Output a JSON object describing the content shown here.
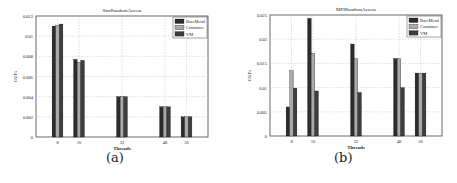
{
  "chart_data": [
    {
      "type": "bar",
      "title": "StarRandomAccess",
      "xlabel": "Threads",
      "ylabel": "GUPs",
      "categories": [
        "8",
        "16",
        "32",
        "48",
        "56"
      ],
      "x_positions": [
        8,
        16,
        32,
        48,
        56
      ],
      "ylim": [
        0,
        0.012
      ],
      "yticks": [
        0,
        0.002,
        0.004,
        0.006,
        0.008,
        0.01,
        0.012
      ],
      "ytick_labels": [
        "0",
        "0.002",
        "0.004",
        "0.006",
        "0.008",
        "0.01",
        "0.012"
      ],
      "grid": true,
      "legend_position": "upper right",
      "series": [
        {
          "name": "BareMetal",
          "color": "#2b2b2b",
          "values": [
            0.011,
            0.0077,
            0.004,
            0.003,
            0.002
          ]
        },
        {
          "name": "Container",
          "color": "#a9a9a9",
          "values": [
            0.0111,
            0.0074,
            0.004,
            0.003,
            0.002
          ]
        },
        {
          "name": "VM",
          "color": "#3d3d3d",
          "values": [
            0.0112,
            0.0076,
            0.004,
            0.003,
            0.002
          ]
        }
      ],
      "caption": "(a)"
    },
    {
      "type": "bar",
      "title": "MPIRandomAccess",
      "xlabel": "Threads",
      "ylabel": "GUPs",
      "categories": [
        "8",
        "16",
        "32",
        "48",
        "56"
      ],
      "x_positions": [
        8,
        16,
        32,
        48,
        56
      ],
      "ylim": [
        0,
        0.025
      ],
      "yticks": [
        0,
        0.005,
        0.01,
        0.015,
        0.02,
        0.025
      ],
      "ytick_labels": [
        "0",
        "0.005",
        "0.01",
        "0.015",
        "0.02",
        "0.025"
      ],
      "grid": true,
      "legend_position": "upper right",
      "series": [
        {
          "name": "BareMetal",
          "color": "#2b2b2b",
          "values": [
            0.006,
            0.0243,
            0.019,
            0.016,
            0.013
          ]
        },
        {
          "name": "Container",
          "color": "#a9a9a9",
          "values": [
            0.0135,
            0.0171,
            0.016,
            0.016,
            0.013
          ]
        },
        {
          "name": "VM",
          "color": "#3d3d3d",
          "values": [
            0.0099,
            0.0093,
            0.009,
            0.01,
            0.013
          ]
        }
      ],
      "caption": "(b)"
    }
  ]
}
